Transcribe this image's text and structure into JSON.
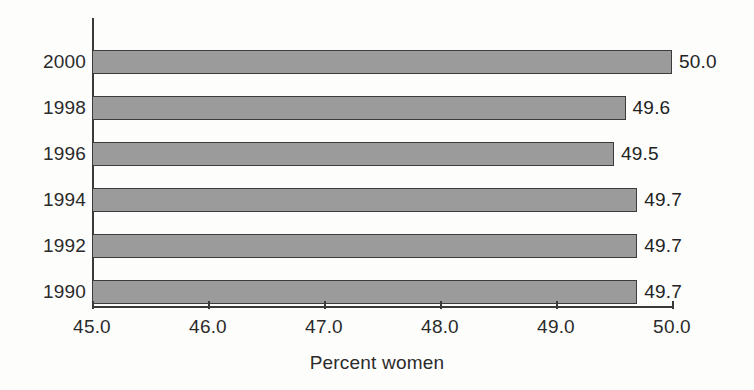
{
  "chart_data": {
    "type": "bar",
    "orientation": "horizontal",
    "title": "",
    "xlabel": "Percent women",
    "ylabel": "",
    "categories": [
      "2000",
      "1998",
      "1996",
      "1994",
      "1992",
      "1990"
    ],
    "values": [
      50.0,
      49.6,
      49.5,
      49.7,
      49.7,
      49.7
    ],
    "data_labels": [
      "50.0",
      "49.6",
      "49.5",
      "49.7",
      "49.7",
      "49.7"
    ],
    "xlim": [
      45.0,
      50.0
    ],
    "xticks": [
      45.0,
      46.0,
      47.0,
      48.0,
      49.0,
      50.0
    ],
    "xtick_labels": [
      "45.0",
      "46.0",
      "47.0",
      "48.0",
      "49.0",
      "50.0"
    ],
    "ytick_labels": [
      "2000",
      "1998",
      "1996",
      "1994",
      "1992",
      "1990"
    ],
    "grid": false,
    "legend": null,
    "colors": {
      "bar_fill": "#9b9b9b",
      "bar_edge": "#3c3c3c",
      "axis": "#3a3a3a",
      "text": "#2b2b2b",
      "background": "#fdfdfc"
    },
    "series": [
      {
        "name": "Percent women",
        "points": [
          {
            "category": "2000",
            "value": 50.0,
            "label": "50.0"
          },
          {
            "category": "1998",
            "value": 49.6,
            "label": "49.6"
          },
          {
            "category": "1996",
            "value": 49.5,
            "label": "49.5"
          },
          {
            "category": "1994",
            "value": 49.7,
            "label": "49.7"
          },
          {
            "category": "1992",
            "value": 49.7,
            "label": "49.7"
          },
          {
            "category": "1990",
            "value": 49.7,
            "label": "49.7"
          }
        ]
      }
    ]
  }
}
